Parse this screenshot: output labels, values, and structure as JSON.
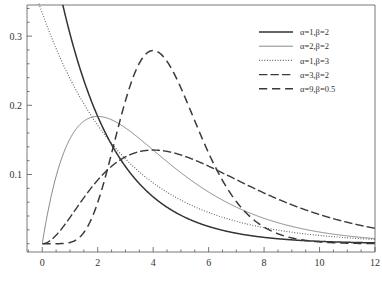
{
  "chart_data": {
    "type": "line",
    "title": "",
    "subtitle": "",
    "xlabel": "",
    "ylabel": "",
    "xlim": [
      -0.55,
      12.0
    ],
    "ylim": [
      -0.012,
      0.345
    ],
    "grid": false,
    "legend_position": "top-right",
    "xticks": [
      0,
      2,
      4,
      6,
      8,
      10,
      12
    ],
    "xtick_labels": [
      "0",
      "2",
      "4",
      "6",
      "8",
      "10",
      "12"
    ],
    "xminor_step": 0.5,
    "yticks": [
      0.1,
      0.2,
      0.3
    ],
    "ytick_labels": [
      "0.1",
      "0.2",
      "0.3"
    ],
    "yminor_step": 0.02,
    "series": [
      {
        "name": "a1b2",
        "label": "α=1,β=2",
        "alpha": 1,
        "beta": 2,
        "style": "solid",
        "width": 1.5,
        "color": "#333333",
        "x": [
          0,
          0.25,
          0.5,
          0.75,
          1,
          1.5,
          2,
          2.5,
          3,
          3.5,
          4,
          4.5,
          5,
          5.5,
          6,
          6.5,
          7,
          7.5,
          8,
          8.5,
          9,
          9.5,
          10,
          10.5,
          11,
          11.5,
          12
        ],
        "y": [
          0.5,
          0.4412,
          0.3894,
          0.3436,
          0.3033,
          0.2361,
          0.1839,
          0.1432,
          0.1116,
          0.0869,
          0.0677,
          0.0527,
          0.041,
          0.032,
          0.0249,
          0.0194,
          0.0151,
          0.0117,
          0.0092,
          0.0072,
          0.0056,
          0.0043,
          0.0034,
          0.0026,
          0.002,
          0.0016,
          0.0012
        ]
      },
      {
        "name": "a2b2",
        "label": "α=2,β=2",
        "alpha": 2,
        "beta": 2,
        "style": "solid",
        "width": 0.7,
        "color": "#555555",
        "x": [
          0,
          0.5,
          1,
          1.5,
          2,
          2.5,
          3,
          3.5,
          4,
          4.5,
          5,
          5.5,
          6,
          6.5,
          7,
          7.5,
          8,
          8.5,
          9,
          9.5,
          10,
          10.5,
          11,
          11.5,
          12
        ],
        "y": [
          0,
          0.0973,
          0.1516,
          0.1771,
          0.1839,
          0.1791,
          0.1674,
          0.152,
          0.1353,
          0.1186,
          0.1026,
          0.0879,
          0.0747,
          0.063,
          0.0528,
          0.044,
          0.0366,
          0.0303,
          0.025,
          0.0206,
          0.0169,
          0.0138,
          0.0113,
          0.0092,
          0.0074
        ]
      },
      {
        "name": "a1b3",
        "label": "α=1,β=3",
        "alpha": 1,
        "beta": 3,
        "style": "dotted",
        "width": 1.1,
        "color": "#555555",
        "x": [
          0,
          0.5,
          1,
          1.5,
          2,
          2.5,
          3,
          3.5,
          4,
          4.5,
          5,
          5.5,
          6,
          6.5,
          7,
          7.5,
          8,
          8.5,
          9,
          9.5,
          10,
          10.5,
          11,
          11.5,
          12
        ],
        "y": [
          0.3333,
          0.2821,
          0.2388,
          0.2021,
          0.1711,
          0.1448,
          0.1226,
          0.1038,
          0.0878,
          0.0743,
          0.0629,
          0.0533,
          0.0451,
          0.0382,
          0.0323,
          0.0273,
          0.0231,
          0.0196,
          0.0166,
          0.014,
          0.0119,
          0.0101,
          0.0085,
          0.0072,
          0.0061
        ]
      },
      {
        "name": "a3b2",
        "label": "α=3,β=2",
        "alpha": 3,
        "beta": 2,
        "style": "dashdot",
        "width": 1.4,
        "color": "#3a3a3a",
        "x": [
          0,
          0.5,
          1,
          1.5,
          2,
          2.5,
          3,
          3.5,
          4,
          4.5,
          5,
          5.5,
          6,
          6.5,
          7,
          7.5,
          8,
          8.5,
          9,
          9.5,
          10,
          10.5,
          11,
          11.5,
          12
        ],
        "y": [
          0,
          0.0122,
          0.0379,
          0.0664,
          0.092,
          0.1119,
          0.1255,
          0.133,
          0.1353,
          0.1334,
          0.1283,
          0.1209,
          0.112,
          0.1023,
          0.0924,
          0.0826,
          0.0733,
          0.0645,
          0.0563,
          0.0489,
          0.0421,
          0.0361,
          0.0308,
          0.0262,
          0.0221
        ]
      },
      {
        "name": "a9b05",
        "label": "α=9,β=0.5",
        "alpha": 9,
        "beta": 0.5,
        "style": "dashed",
        "width": 1.5,
        "color": "#3a3a3a",
        "x": [
          0,
          0.5,
          1,
          1.5,
          2,
          2.5,
          3,
          3.5,
          4,
          4.5,
          5,
          5.5,
          6,
          6.5,
          7,
          7.5,
          8,
          8.5,
          9,
          9.5,
          10,
          10.5,
          11,
          11.5,
          12
        ],
        "y": [
          0,
          0.0,
          0.0011,
          0.009,
          0.0298,
          0.0632,
          0.1033,
          0.1418,
          0.1728,
          0.1931,
          0.2022,
          0.2013,
          0.1926,
          0.1784,
          0.161,
          0.1422,
          0.1233,
          0.1052,
          0.0886,
          0.0738,
          0.0608,
          0.0496,
          0.0401,
          0.0321,
          0.0255
        ]
      }
    ]
  },
  "legend": {
    "entries": [
      {
        "label": "α=1,β=2"
      },
      {
        "label": "α=2,β=2"
      },
      {
        "label": "α=1,β=3"
      },
      {
        "label": "α=3,β=2"
      },
      {
        "label": "α=9,β=0.5"
      }
    ]
  }
}
